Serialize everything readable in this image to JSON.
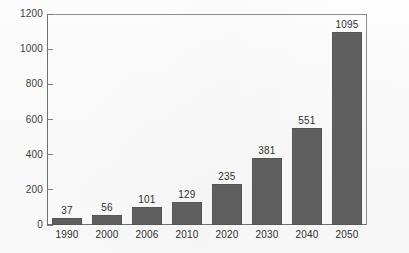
{
  "chart_data": {
    "type": "bar",
    "title": "",
    "subtitle": "",
    "xlabel": "",
    "ylabel": "",
    "categories": [
      "1990",
      "2000",
      "2006",
      "2010",
      "2020",
      "2030",
      "2040",
      "2050"
    ],
    "values": [
      37,
      56,
      101,
      129,
      235,
      381,
      551,
      1095
    ],
    "value_labels": [
      "37",
      "56",
      "101",
      "129",
      "235",
      "381",
      "551",
      "1095"
    ],
    "ylim": [
      0,
      1200
    ],
    "ytick_values": [
      0,
      200,
      400,
      600,
      800,
      1000,
      1200
    ],
    "ytick_labels": [
      "0",
      "200",
      "400",
      "600",
      "800",
      "1000",
      "1200"
    ],
    "grid": false,
    "legend": null,
    "legend_position": "none",
    "series": [
      {
        "name": "",
        "values": [
          37,
          56,
          101,
          129,
          235,
          381,
          551,
          1095
        ]
      }
    ],
    "bar_color": "#5f5f5f",
    "axis_color": "#6f6f6f",
    "background_color": "#fdfdfd",
    "annotations": []
  }
}
